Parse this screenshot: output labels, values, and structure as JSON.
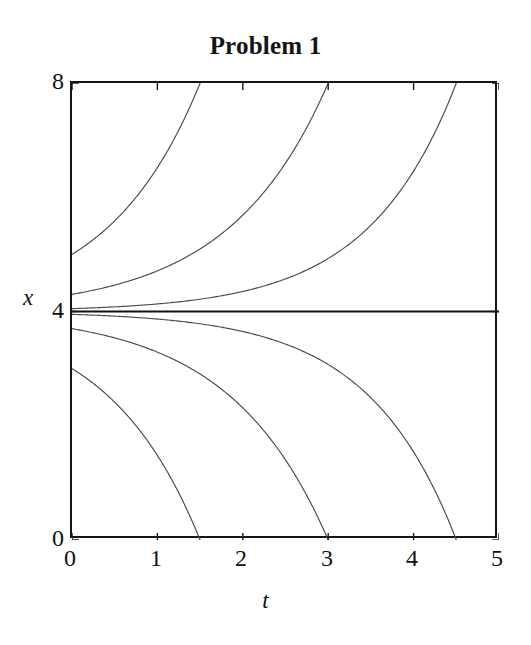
{
  "chart_data": {
    "type": "line",
    "title": "Problem 1",
    "xlabel": "t",
    "ylabel": "x",
    "xlim": [
      0,
      5
    ],
    "ylim": [
      0,
      8
    ],
    "xticks": [
      "0",
      "1",
      "2",
      "3",
      "4",
      "5"
    ],
    "xtick_values": [
      0,
      1,
      2,
      3,
      4,
      5
    ],
    "yticks": [
      "0",
      "4",
      "8"
    ],
    "ytick_values": [
      0,
      4,
      8
    ],
    "grid": false,
    "legend": null,
    "equilibrium": 4,
    "series": [
      {
        "name": "x0 = 5.0",
        "x0": 0,
        "y0": 5.0,
        "points_x": [
          0.0,
          0.25,
          0.5,
          0.75,
          1.0,
          1.25,
          1.5
        ],
        "points_y": [
          5.0,
          5.28,
          5.64,
          6.08,
          6.64,
          7.24,
          8.0
        ]
      },
      {
        "name": "x0 = 4.3",
        "x0": 0,
        "y0": 4.3,
        "points_x": [
          0.0,
          0.5,
          1.0,
          1.5,
          2.0,
          2.25,
          2.5,
          2.75,
          3.0
        ],
        "points_y": [
          4.3,
          4.4,
          4.55,
          4.8,
          5.28,
          5.64,
          6.08,
          6.92,
          8.0
        ]
      },
      {
        "name": "x0 = 4.05",
        "x0": 0,
        "y0": 4.05,
        "points_x": [
          0.0,
          1.0,
          2.0,
          2.5,
          3.0,
          3.5,
          4.0,
          4.25,
          4.5
        ],
        "points_y": [
          4.05,
          4.09,
          4.2,
          4.32,
          4.55,
          4.9,
          5.55,
          6.35,
          8.0
        ]
      },
      {
        "name": "equilibrium x = 4",
        "x0": 0,
        "y0": 4.0,
        "points_x": [
          0.0,
          5.0
        ],
        "points_y": [
          4.0,
          4.0
        ]
      },
      {
        "name": "x0 = 3.95",
        "x0": 0,
        "y0": 3.95,
        "points_x": [
          0.0,
          1.0,
          2.0,
          2.5,
          3.0,
          3.5,
          4.0,
          4.25,
          4.5
        ],
        "points_y": [
          3.95,
          3.91,
          3.8,
          3.68,
          3.45,
          3.1,
          2.45,
          1.65,
          0.0
        ]
      },
      {
        "name": "x0 = 3.7",
        "x0": 0,
        "y0": 3.7,
        "points_x": [
          0.0,
          0.5,
          1.0,
          1.5,
          2.0,
          2.25,
          2.5,
          2.75,
          3.0
        ],
        "points_y": [
          3.7,
          3.6,
          3.45,
          3.2,
          2.72,
          2.36,
          1.92,
          1.08,
          0.0
        ]
      },
      {
        "name": "x0 = 3.0",
        "x0": 0,
        "y0": 3.0,
        "points_x": [
          0.0,
          0.25,
          0.5,
          0.75,
          1.0,
          1.25,
          1.5
        ],
        "points_y": [
          3.0,
          2.72,
          2.36,
          1.92,
          1.36,
          0.76,
          0.0
        ]
      }
    ],
    "colors": {
      "curve": "#4a4a4a",
      "equilibrium": "#101010",
      "frame": "#161616",
      "background": "#ffffff",
      "text": "#111111"
    }
  }
}
